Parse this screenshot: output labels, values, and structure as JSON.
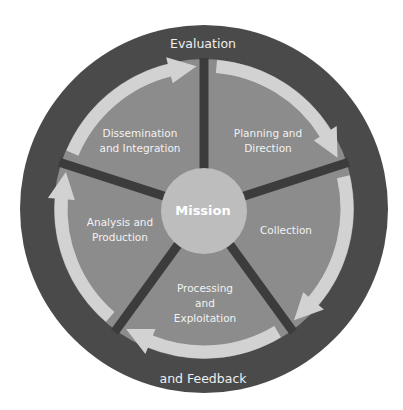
{
  "diagram": {
    "title_cutoff": "Figure 1. The Intelligence Cycle",
    "outer_ring": {
      "top_label": "Evaluation",
      "bottom_label": "and Feedback"
    },
    "center": {
      "label": "Mission"
    },
    "segments": [
      {
        "id": "planning",
        "line1": "Planning and",
        "line2": "Direction"
      },
      {
        "id": "collection",
        "line1": "Collection",
        "line2": ""
      },
      {
        "id": "processing",
        "line1": "Processing",
        "line2": "and",
        "line3": "Exploitation"
      },
      {
        "id": "analysis",
        "line1": "Analysis and",
        "line2": "Production"
      },
      {
        "id": "dissemination",
        "line1": "Dissemination",
        "line2": "and Integration"
      }
    ],
    "colors": {
      "outer_ring": "#4a4a4a",
      "segment_fill": "#8c8c8c",
      "arrow": "#d2d2d2",
      "divider": "#3c3c3c",
      "center": "#bdbdbd",
      "text": "#f2f2f2"
    }
  }
}
